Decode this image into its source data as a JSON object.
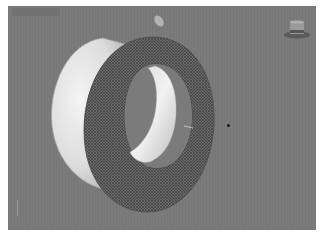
{
  "viewport": {
    "background": "#7b7b7b",
    "border_color": "#ffffff",
    "label_visible_but_illegible": true
  },
  "scene": {
    "objects": [
      {
        "name": "torus-shaded",
        "style": "shaded-white",
        "color": "#e8e8e8"
      },
      {
        "name": "torus-wireframe",
        "style": "wireframe",
        "color": "#3c3c3c"
      }
    ],
    "light": {
      "icon": "light-source-icon",
      "color": "#bdbdbd"
    },
    "pivot_dot": {
      "icon": "pivot-point-icon",
      "color": "#1a1a1a"
    }
  },
  "navigation": {
    "viewcube_icon": "viewcube-home-icon",
    "axis_icon": "axis-tripod-icon"
  }
}
